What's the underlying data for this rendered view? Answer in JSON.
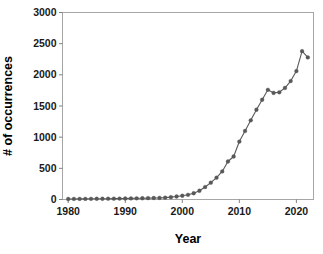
{
  "chart_data": {
    "type": "line",
    "title": "",
    "xlabel": "Year",
    "ylabel": "# of occurrences",
    "xlim": [
      1979,
      2023
    ],
    "ylim": [
      0,
      3000
    ],
    "grid": false,
    "legend": "none",
    "marker": "circle",
    "line_color": "#595959",
    "marker_color": "#595959",
    "frame_color": "#a6a6a6",
    "x_ticks": [
      1980,
      1990,
      2000,
      2010,
      2020
    ],
    "y_ticks": [
      0,
      500,
      1000,
      1500,
      2000,
      2500,
      3000
    ],
    "x_tick_labels": [
      "1980",
      "1990",
      "2000",
      "2010",
      "2020"
    ],
    "y_tick_labels": [
      "0",
      "500",
      "1000",
      "1500",
      "2000",
      "2500",
      "3000"
    ],
    "x": [
      1980,
      1981,
      1982,
      1983,
      1984,
      1985,
      1986,
      1987,
      1988,
      1989,
      1990,
      1991,
      1992,
      1993,
      1994,
      1995,
      1996,
      1997,
      1998,
      1999,
      2000,
      2001,
      2002,
      2003,
      2004,
      2005,
      2006,
      2007,
      2008,
      2009,
      2010,
      2011,
      2012,
      2013,
      2014,
      2015,
      2016,
      2017,
      2018,
      2019,
      2020,
      2021,
      2022
    ],
    "values": [
      8,
      9,
      10,
      10,
      11,
      12,
      12,
      13,
      14,
      15,
      16,
      18,
      19,
      20,
      22,
      24,
      26,
      30,
      38,
      48,
      60,
      75,
      100,
      140,
      200,
      270,
      350,
      450,
      610,
      690,
      930,
      1100,
      1270,
      1440,
      1600,
      1760,
      1710,
      1720,
      1790,
      1900,
      2060,
      2380,
      2280
    ]
  }
}
